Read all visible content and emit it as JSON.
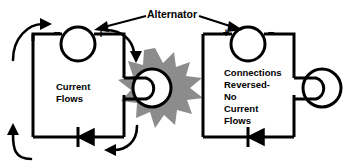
{
  "diagram": {
    "title_callout": {
      "label": "Alternator",
      "icon": "leader-line-arrow"
    },
    "colors": {
      "line": "#000000",
      "background": "#ffffff",
      "spark": "#8c8c8c",
      "text": "#000000"
    },
    "panels": [
      {
        "id": "left",
        "caption_lines": [
          "Current",
          "Flows"
        ],
        "caption_text": "Current Flows",
        "alternator": {
          "name": "alternator-left",
          "terminal_left": "–",
          "terminal_right": "+"
        },
        "load": {
          "name": "electromagnet-coil",
          "energized": true,
          "spark_label": "spark-burst"
        },
        "diode": {
          "name": "diode-left",
          "orientation": "points-left"
        },
        "flow_arrows": [
          {
            "name": "flow-arrow-top-left",
            "direction": "right"
          },
          {
            "name": "flow-arrow-top-right",
            "direction": "down"
          },
          {
            "name": "flow-arrow-bottom-right",
            "direction": "left"
          },
          {
            "name": "flow-arrow-bottom-left",
            "direction": "up"
          }
        ]
      },
      {
        "id": "right",
        "caption_lines": [
          "Connections",
          "Reversed-",
          "No",
          "Current",
          "Flows"
        ],
        "caption_text": "Connections Reversed- No Current Flows",
        "alternator": {
          "name": "alternator-right",
          "terminal_left": "+",
          "terminal_right": "–"
        },
        "load": {
          "name": "electromagnet-coil",
          "energized": false,
          "spark_label": ""
        },
        "diode": {
          "name": "diode-right",
          "orientation": "points-left"
        },
        "flow_arrows": []
      }
    ]
  }
}
